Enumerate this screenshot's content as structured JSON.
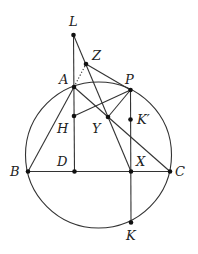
{
  "figure": {
    "circle": {
      "cx": 98.5,
      "cy": 155,
      "r": 73
    },
    "points": {
      "L": {
        "x": 73.5,
        "y": 35,
        "label": "L",
        "lx": 69,
        "ly": 26
      },
      "Z": {
        "x": 86,
        "y": 64,
        "label": "Z",
        "lx": 92,
        "ly": 60
      },
      "A": {
        "x": 74,
        "y": 87,
        "label": "A",
        "lx": 59,
        "ly": 84
      },
      "P": {
        "x": 130.5,
        "y": 90,
        "label": "P",
        "lx": 125,
        "ly": 84
      },
      "H": {
        "x": 74,
        "y": 116,
        "label": "H",
        "lx": 57,
        "ly": 133
      },
      "Y": {
        "x": 108,
        "y": 117,
        "label": "Y",
        "lx": 92,
        "ly": 133
      },
      "Kp": {
        "x": 130.5,
        "y": 119.5,
        "label": "K′",
        "lx": 137,
        "ly": 124
      },
      "B": {
        "x": 28,
        "y": 171.5,
        "label": "B",
        "lx": 10,
        "ly": 176
      },
      "D": {
        "x": 74.5,
        "y": 171.5,
        "label": "D",
        "lx": 57,
        "ly": 166
      },
      "X": {
        "x": 131,
        "y": 171.5,
        "label": "X",
        "lx": 136,
        "ly": 166
      },
      "C": {
        "x": 170,
        "y": 171.5,
        "label": "C",
        "lx": 175,
        "ly": 176
      },
      "K": {
        "x": 131,
        "y": 222.5,
        "label": "K",
        "lx": 126,
        "ly": 240
      }
    },
    "segments": [
      {
        "from": "L",
        "to": "D"
      },
      {
        "from": "L",
        "to": "X"
      },
      {
        "from": "Z",
        "to": "P"
      },
      {
        "from": "A",
        "to": "B"
      },
      {
        "from": "A",
        "to": "C"
      },
      {
        "from": "H",
        "to": "P"
      },
      {
        "from": "P",
        "to": "Y"
      },
      {
        "from": "P",
        "to": "K"
      },
      {
        "from": "B",
        "to": "C"
      }
    ],
    "dotted_segments": [
      {
        "from": "A",
        "to": "Z"
      }
    ]
  }
}
